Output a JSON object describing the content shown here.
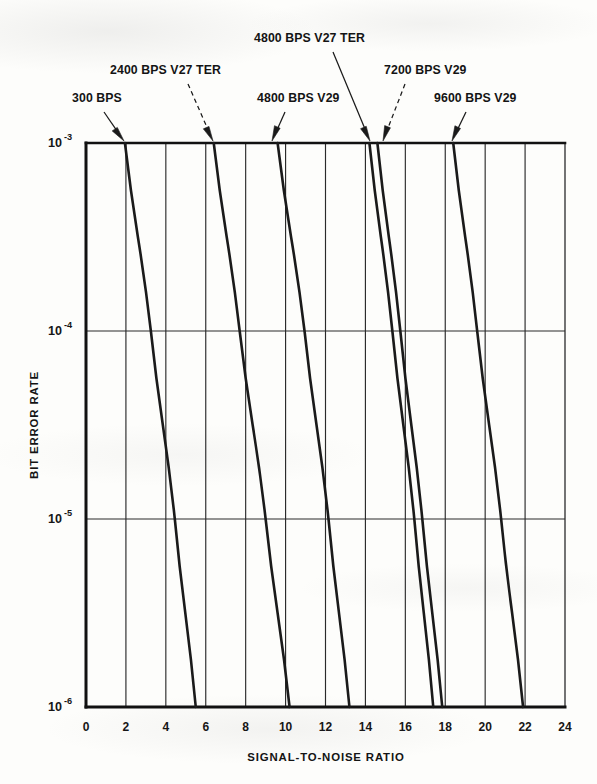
{
  "chart_data": {
    "type": "line",
    "title": "",
    "xlabel": "SIGNAL-TO-NOISE RATIO",
    "ylabel": "BIT ERROR RATE",
    "xlim": [
      0,
      24
    ],
    "ylim": [
      1e-06,
      0.001
    ],
    "yscale": "log",
    "grid": true,
    "legend_position": "annotations",
    "x_ticks": [
      0,
      2,
      4,
      6,
      8,
      10,
      12,
      14,
      16,
      18,
      20,
      22,
      24
    ],
    "x_tick_labels": [
      "0",
      "2",
      "4",
      "6",
      "8",
      "10",
      "12",
      "14",
      "16",
      "18",
      "20",
      "22",
      "24"
    ],
    "y_ticks": [
      0.001,
      0.0001,
      1e-05,
      1e-06
    ],
    "y_tick_labels": [
      "10⁻³",
      "10⁻⁴",
      "10⁻⁵",
      "10⁻⁶"
    ],
    "y_tick_mantissa": [
      "10",
      "10",
      "10",
      "10"
    ],
    "y_tick_exponents": [
      "-3",
      "-4",
      "-5",
      "-6"
    ],
    "x_minor_gridlines": [
      2,
      4,
      6,
      8,
      10,
      12,
      14,
      16,
      18,
      20,
      22
    ],
    "series": [
      {
        "name": "300 BPS",
        "points": [
          {
            "snr": 1.95,
            "ber": 0.001
          },
          {
            "snr": 3.25,
            "ber": 0.0001
          },
          {
            "snr": 4.45,
            "ber": 1e-05
          },
          {
            "snr": 5.5,
            "ber": 1e-06
          }
        ]
      },
      {
        "name": "2400 BPS V27 TER",
        "points": [
          {
            "snr": 6.4,
            "ber": 0.001
          },
          {
            "snr": 7.7,
            "ber": 0.0001
          },
          {
            "snr": 9.0,
            "ber": 1e-05
          },
          {
            "snr": 10.2,
            "ber": 1e-06
          }
        ]
      },
      {
        "name": "4800 BPS V29",
        "points": [
          {
            "snr": 9.6,
            "ber": 0.001
          },
          {
            "snr": 10.95,
            "ber": 0.0001
          },
          {
            "snr": 12.15,
            "ber": 1e-05
          },
          {
            "snr": 13.2,
            "ber": 1e-06
          }
        ]
      },
      {
        "name": "4800 BPS V27 TER",
        "points": [
          {
            "snr": 14.2,
            "ber": 0.001
          },
          {
            "snr": 15.35,
            "ber": 0.0001
          },
          {
            "snr": 16.45,
            "ber": 1e-05
          },
          {
            "snr": 17.4,
            "ber": 1e-06
          }
        ]
      },
      {
        "name": "7200 BPS V29",
        "points": [
          {
            "snr": 14.6,
            "ber": 0.001
          },
          {
            "snr": 15.75,
            "ber": 0.0001
          },
          {
            "snr": 16.85,
            "ber": 1e-05
          },
          {
            "snr": 17.85,
            "ber": 1e-06
          }
        ]
      },
      {
        "name": "9600 BPS V29",
        "points": [
          {
            "snr": 18.4,
            "ber": 0.001
          },
          {
            "snr": 19.6,
            "ber": 0.0001
          },
          {
            "snr": 20.8,
            "ber": 1e-05
          },
          {
            "snr": 21.9,
            "ber": 1e-06
          }
        ]
      }
    ],
    "annotations": [
      {
        "label": "300 BPS",
        "text_x": 72,
        "text_y": 102,
        "arrow_from_x": 104,
        "arrow_from_y": 112,
        "arrow_to_x": 124,
        "arrow_to_y": 141,
        "style": "solid"
      },
      {
        "label": "2400 BPS V27 TER",
        "text_x": 110,
        "text_y": 74,
        "arrow_from_x": 188,
        "arrow_from_y": 84,
        "arrow_to_x": 213,
        "arrow_to_y": 141,
        "style": "dashed"
      },
      {
        "label": "4800 BPS V29",
        "text_x": 257,
        "text_y": 102,
        "arrow_from_x": 285,
        "arrow_from_y": 112,
        "arrow_to_x": 272,
        "arrow_to_y": 141,
        "style": "solid"
      },
      {
        "label": "4800 BPS V27 TER",
        "text_x": 254,
        "text_y": 42,
        "arrow_from_x": 333,
        "arrow_from_y": 52,
        "arrow_to_x": 370,
        "arrow_to_y": 141,
        "style": "solid"
      },
      {
        "label": "7200 BPS V29",
        "text_x": 384,
        "text_y": 74,
        "arrow_from_x": 405,
        "arrow_from_y": 84,
        "arrow_to_x": 383,
        "arrow_to_y": 141,
        "style": "dashed"
      },
      {
        "label": "9600 BPS V29",
        "text_x": 434,
        "text_y": 102,
        "arrow_from_x": 466,
        "arrow_from_y": 112,
        "arrow_to_x": 452,
        "arrow_to_y": 141,
        "style": "solid"
      }
    ],
    "colors": {
      "curve": "#1a1a1a",
      "grid": "#2a2a2a",
      "axis": "#111111",
      "text": "#141414",
      "background": "#fdfdfb"
    }
  }
}
